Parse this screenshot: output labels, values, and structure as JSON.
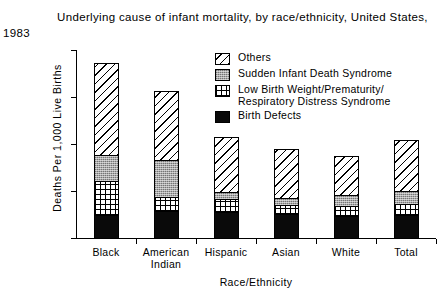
{
  "title": {
    "line1": "Underlying cause of infant mortality, by race/ethnicity, United States,",
    "line2": "1983"
  },
  "legend": {
    "items": [
      {
        "label": "Others",
        "pattern": "diagonal-hatch",
        "color": "#ffffff"
      },
      {
        "label": "Sudden Infant Death Syndrome",
        "pattern": "gray-stipple",
        "color": "#a8a8a8"
      },
      {
        "label": "Low Birth Weight/Prematurity/\nRespiratory Distress Syndrome",
        "pattern": "checkerboard",
        "color": "#ffffff"
      },
      {
        "label": "Birth Defects",
        "pattern": "solid-black",
        "color": "#0a0a0a"
      }
    ]
  },
  "axes": {
    "y_title": "Deaths Per 1,000 Live Births",
    "x_title": "Race/Ethnicity",
    "y_ticks": [
      "0",
      "5",
      "10",
      "15",
      "20"
    ]
  },
  "chart_data": {
    "type": "bar",
    "subtype": "stacked",
    "title": "Underlying cause of infant mortality, by race/ethnicity, United States, 1983",
    "xlabel": "Race/Ethnicity",
    "ylabel": "Deaths Per 1,000 Live Births",
    "ylim": [
      0,
      20
    ],
    "yticks": [
      0,
      5,
      10,
      15,
      20
    ],
    "grid": false,
    "legend_position": "upper-right-inside",
    "categories": [
      "Black",
      "American Indian",
      "Hispanic",
      "Asian",
      "White",
      "Total"
    ],
    "series": [
      {
        "name": "Birth Defects",
        "values": [
          2.4,
          2.9,
          2.8,
          2.6,
          2.3,
          2.4
        ]
      },
      {
        "name": "Low Birth Weight/Prematurity/Respiratory Distress Syndrome",
        "values": [
          3.7,
          1.5,
          1.4,
          0.9,
          1.1,
          1.2
        ]
      },
      {
        "name": "Sudden Infant Death Syndrome",
        "values": [
          2.7,
          3.9,
          0.7,
          0.8,
          1.2,
          1.4
        ]
      },
      {
        "name": "Others",
        "values": [
          9.8,
          7.3,
          5.8,
          5.2,
          4.1,
          5.4
        ]
      }
    ],
    "totals": [
      18.6,
      15.6,
      10.7,
      9.5,
      8.7,
      10.4
    ]
  }
}
